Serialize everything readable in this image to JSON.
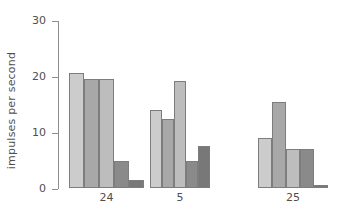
{
  "chart_data": {
    "type": "bar",
    "title": "",
    "subtitle": "",
    "xlabel": "",
    "ylabel": "impulses per second",
    "ylim": [
      0,
      30
    ],
    "yticks": [
      0,
      10,
      20,
      30
    ],
    "ytick_labels": [
      "0",
      "10",
      "20",
      "30"
    ],
    "grid": false,
    "legend": false,
    "legend_position": "none",
    "bars_per_group": 5,
    "categories": [
      "24",
      "5",
      "25"
    ],
    "series": [
      {
        "name": "bar-1",
        "color": "#cccccc",
        "values": [
          20.6,
          14.0,
          9.0
        ]
      },
      {
        "name": "bar-2",
        "color": "#a8a8a8",
        "values": [
          19.4,
          12.4,
          15.3
        ]
      },
      {
        "name": "bar-3",
        "color": "#bdbdbd",
        "values": [
          19.4,
          19.1,
          7.0
        ]
      },
      {
        "name": "bar-4",
        "color": "#8a8a8a",
        "values": [
          4.8,
          4.9,
          7.0
        ]
      },
      {
        "name": "bar-5",
        "color": "#787878",
        "values": [
          1.5,
          7.5,
          0.6
        ]
      }
    ],
    "groups": [
      {
        "label": "24",
        "bars": [
          {
            "value": 20.6,
            "color": "#cccccc"
          },
          {
            "value": 19.4,
            "color": "#a8a8a8"
          },
          {
            "value": 19.4,
            "color": "#bdbdbd"
          },
          {
            "value": 4.8,
            "color": "#8a8a8a"
          },
          {
            "value": 1.5,
            "color": "#787878"
          }
        ]
      },
      {
        "label": "5",
        "bars": [
          {
            "value": 14.0,
            "color": "#cccccc"
          },
          {
            "value": 12.4,
            "color": "#a8a8a8"
          },
          {
            "value": 19.1,
            "color": "#bdbdbd"
          },
          {
            "value": 4.9,
            "color": "#8a8a8a"
          },
          {
            "value": 7.5,
            "color": "#787878"
          }
        ]
      },
      {
        "label": "25",
        "bars": [
          {
            "value": 9.0,
            "color": "#cccccc"
          },
          {
            "value": 15.3,
            "color": "#a8a8a8"
          },
          {
            "value": 7.0,
            "color": "#bdbdbd"
          },
          {
            "value": 7.0,
            "color": "#8a8a8a"
          },
          {
            "value": 0.6,
            "color": "#787878"
          }
        ]
      }
    ]
  },
  "axis": {
    "y_title": "impulses per second",
    "y_tick_0": "0",
    "y_tick_1": "10",
    "y_tick_2": "20",
    "y_tick_3": "30"
  },
  "layout": {
    "group_left_px": [
      69,
      150,
      258
    ],
    "group_bar_width_px": [
      15,
      12,
      14
    ],
    "axis_color": "#8d8d8d",
    "bar_edge_color": "#7d7d7d",
    "text_color": "#4f4f4f"
  }
}
